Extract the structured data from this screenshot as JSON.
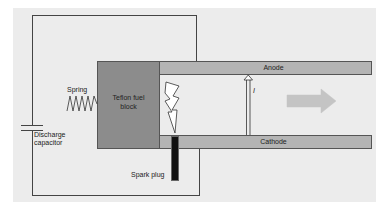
{
  "diagram": {
    "components": {
      "anode": "Anode",
      "cathode": "Cathode",
      "fuel_block": "Teflon fuel block",
      "spring": "Spring",
      "capacitor_line1": "Discharge",
      "capacitor_line2": "capacitor",
      "spark_plug": "Spark plug",
      "thrust": "Thrust",
      "current": "I"
    },
    "colors": {
      "panel": "#ececec",
      "electrode": "#b4b4b4",
      "fuel_block": "#8c8c8c",
      "spark_plug": "#111111",
      "wire": "#444444",
      "thrust_arrow": "#c4c4c4"
    }
  }
}
